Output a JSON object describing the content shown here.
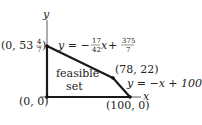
{
  "diagram": {
    "axes": {
      "x_label": "x",
      "y_label": "y"
    },
    "region_label": {
      "line1": "feasible",
      "line2": "set"
    },
    "vertices": [
      {
        "id": "origin",
        "label": "(0, 0)"
      },
      {
        "id": "top",
        "label_prefix": "(0, 53",
        "frac_num": "4",
        "frac_den": "7",
        "label_suffix": ")"
      },
      {
        "id": "corner",
        "label": "(78, 22)"
      },
      {
        "id": "xint",
        "label": "(100, 0)"
      }
    ],
    "equations": {
      "upper": {
        "lhs": "y = −",
        "c1_num": "17",
        "c1_den": "42",
        "var": "x",
        "plus": " + ",
        "c2_num": "375",
        "c2_den": "7"
      },
      "lower": {
        "text": "y = −x + 100"
      }
    },
    "colors": {
      "line": "#1a1a1a",
      "text": "#222222",
      "background": "#ffffff"
    }
  }
}
